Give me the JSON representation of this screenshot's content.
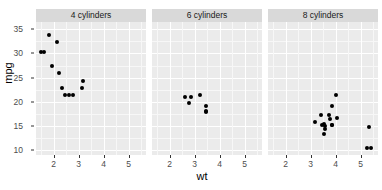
{
  "chart_data": {
    "type": "scatter",
    "title": "",
    "xlabel": "wt",
    "ylabel": "mpg",
    "xlim": [
      1.3,
      5.7
    ],
    "ylim": [
      9.0,
      36.5
    ],
    "xticks": [
      2,
      3,
      4,
      5
    ],
    "yticks": [
      10,
      15,
      20,
      25,
      30,
      35
    ],
    "grid": true,
    "legend": "none",
    "facet_variable": "cyl",
    "facets": [
      {
        "label": "4 cylinders",
        "points": [
          {
            "x": 1.513,
            "y": 30.4
          },
          {
            "x": 1.615,
            "y": 30.4
          },
          {
            "x": 1.835,
            "y": 33.9
          },
          {
            "x": 1.935,
            "y": 27.3
          },
          {
            "x": 2.14,
            "y": 32.4
          },
          {
            "x": 2.2,
            "y": 26.0
          },
          {
            "x": 2.32,
            "y": 22.8
          },
          {
            "x": 2.465,
            "y": 21.5
          },
          {
            "x": 2.62,
            "y": 21.4
          },
          {
            "x": 2.78,
            "y": 21.4
          },
          {
            "x": 3.15,
            "y": 22.8
          },
          {
            "x": 3.19,
            "y": 24.4
          }
        ]
      },
      {
        "label": "6 cylinders",
        "points": [
          {
            "x": 2.62,
            "y": 21.0
          },
          {
            "x": 2.77,
            "y": 19.7
          },
          {
            "x": 2.875,
            "y": 21.0
          },
          {
            "x": 3.215,
            "y": 21.4
          },
          {
            "x": 3.44,
            "y": 19.2
          },
          {
            "x": 3.46,
            "y": 18.1
          },
          {
            "x": 3.44,
            "y": 17.8
          }
        ]
      },
      {
        "label": "8 cylinders",
        "points": [
          {
            "x": 3.17,
            "y": 15.8
          },
          {
            "x": 3.435,
            "y": 17.3
          },
          {
            "x": 3.44,
            "y": 15.2
          },
          {
            "x": 3.52,
            "y": 15.5
          },
          {
            "x": 3.57,
            "y": 14.3
          },
          {
            "x": 3.57,
            "y": 15.0
          },
          {
            "x": 3.73,
            "y": 17.3
          },
          {
            "x": 3.78,
            "y": 16.4
          },
          {
            "x": 3.84,
            "y": 15.2
          },
          {
            "x": 3.845,
            "y": 15.2
          },
          {
            "x": 4.07,
            "y": 16.7
          },
          {
            "x": 3.845,
            "y": 19.2
          },
          {
            "x": 3.52,
            "y": 13.3
          },
          {
            "x": 5.25,
            "y": 10.4
          },
          {
            "x": 5.424,
            "y": 10.4
          },
          {
            "x": 5.345,
            "y": 14.7
          },
          {
            "x": 4.0,
            "y": 21.5
          }
        ]
      }
    ]
  },
  "axes": {
    "y_tick_labels": [
      "35",
      "30",
      "25",
      "20",
      "15",
      "10"
    ],
    "x_tick_labels": [
      "2",
      "3",
      "4",
      "5"
    ],
    "y_title": "mpg",
    "x_title": "wt"
  },
  "strips": {
    "panel1": "4 cylinders",
    "panel2": "6 cylinders",
    "panel3": "8 cylinders"
  },
  "colors": {
    "panel_background": "#ebebeb",
    "strip_background": "#d9d9d9",
    "major_gridline": "#ffffff",
    "minor_gridline": "#f7f7f7",
    "point": "#000000",
    "axis_text": "#4d4d4d",
    "plot_background": "#ffffff"
  }
}
